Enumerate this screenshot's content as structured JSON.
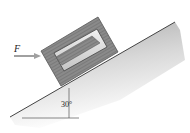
{
  "diagram": {
    "type": "inclined-plane-block",
    "force_label": "F",
    "angle_label": "30°",
    "angle_degrees": 30,
    "colors": {
      "block_outer": "#808080",
      "block_inner_light": "#d8d8d8",
      "block_inner_dark": "#7a7a7a",
      "incline_fill": "#c8c8c8",
      "arrow": "#a0a0a0",
      "line": "#333333"
    }
  }
}
